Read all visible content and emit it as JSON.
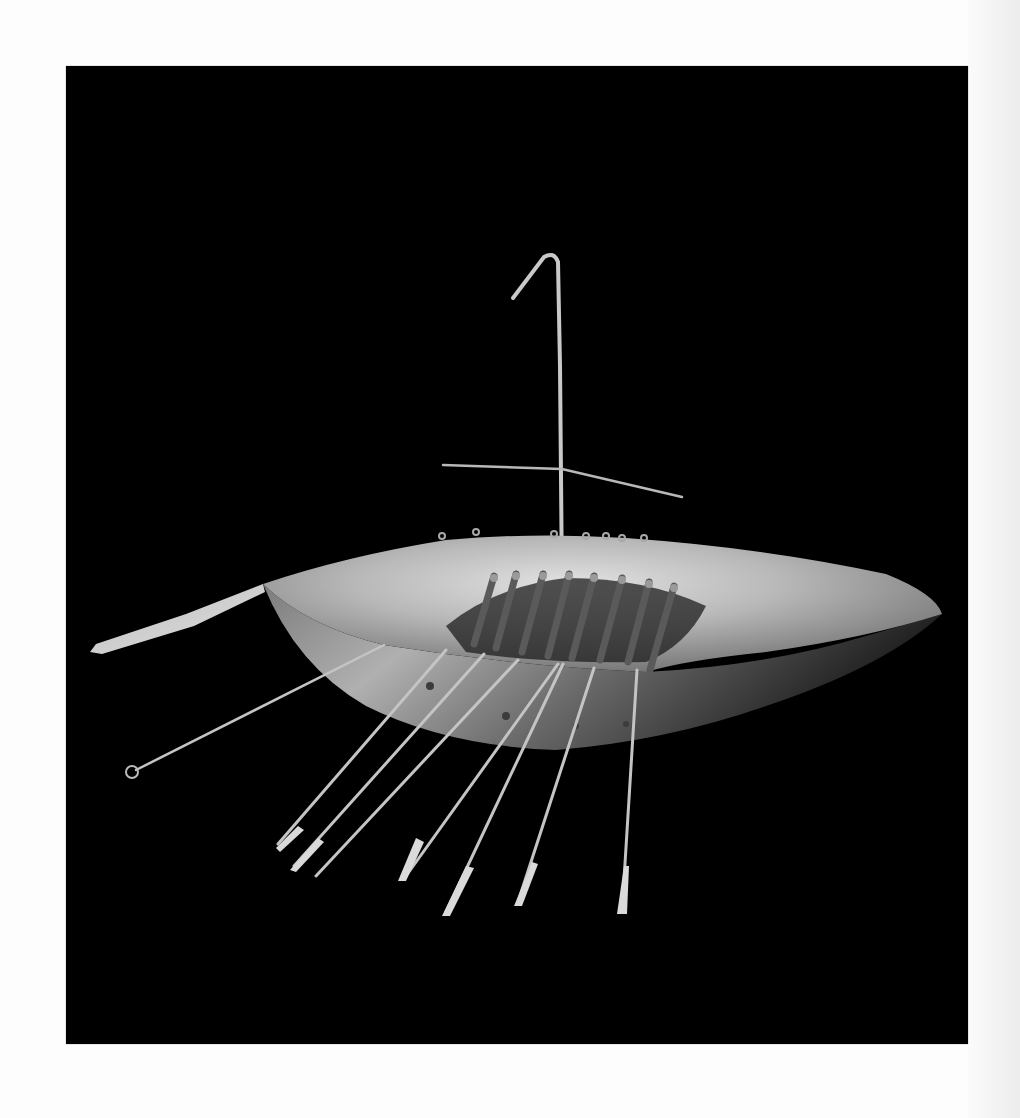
{
  "image": {
    "subject": "gold model boat with oars and mast",
    "background_color": "#000000",
    "page_color": "#fdfdfd",
    "metal_colors": {
      "highlight": "#d8d8d8",
      "mid": "#9a9a9a",
      "shadow": "#3a3a3a",
      "oar": "#cfcfcf"
    }
  },
  "geometry": {
    "frame": {
      "x": 66,
      "y": 66,
      "width": 902,
      "height": 978
    },
    "mast": {
      "x1": 496,
      "y1": 522,
      "x2": 492,
      "y2": 196,
      "hook_x": 478,
      "hook_y": 191,
      "hook_end_x": 447,
      "hook_end_y": 232
    },
    "yard": {
      "x1": 377,
      "y1": 399,
      "x2": 616,
      "y2": 431
    },
    "steering_oar": {
      "x1": 197,
      "y1": 518,
      "x2": 24,
      "y2": 585
    },
    "oars": [
      {
        "x1": 318,
        "y1": 579,
        "x2": 64,
        "y2": 706
      },
      {
        "x1": 380,
        "y1": 584,
        "x2": 209,
        "y2": 780
      },
      {
        "x1": 418,
        "y1": 588,
        "x2": 225,
        "y2": 801
      },
      {
        "x1": 452,
        "y1": 594,
        "x2": 248,
        "y2": 811
      },
      {
        "x1": 492,
        "y1": 598,
        "x2": 335,
        "y2": 813
      },
      {
        "x1": 497,
        "y1": 598,
        "x2": 376,
        "y2": 848
      },
      {
        "x1": 528,
        "y1": 602,
        "x2": 449,
        "y2": 838
      },
      {
        "x1": 571,
        "y1": 604,
        "x2": 555,
        "y2": 847
      }
    ],
    "thwarts": [
      {
        "x": 428,
        "y": 510
      },
      {
        "x": 450,
        "y": 508
      },
      {
        "x": 477,
        "y": 508
      },
      {
        "x": 503,
        "y": 508
      },
      {
        "x": 528,
        "y": 510
      },
      {
        "x": 556,
        "y": 512
      },
      {
        "x": 583,
        "y": 516
      },
      {
        "x": 608,
        "y": 520
      }
    ]
  }
}
